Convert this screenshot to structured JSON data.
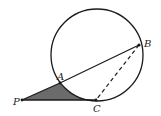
{
  "diagram": {
    "type": "geometry",
    "colors": {
      "stroke": "#1a1a1a",
      "shade": "#6b6b6b",
      "background": "#ffffff"
    },
    "circle": {
      "cx": 97,
      "cy": 55,
      "r": 46
    },
    "points": {
      "P": {
        "label": "P",
        "x": 22,
        "y": 100
      },
      "A": {
        "label": "A",
        "x": 60,
        "y": 83
      },
      "B": {
        "label": "B",
        "x": 139,
        "y": 45
      },
      "C": {
        "label": "C",
        "x": 96,
        "y": 100
      }
    },
    "segments": [
      {
        "from": "A",
        "to": "B",
        "style": "solid"
      },
      {
        "from": "P",
        "to": "A",
        "style": "solid"
      },
      {
        "from": "P",
        "to": "C",
        "style": "solid"
      },
      {
        "from": "B",
        "to": "C",
        "style": "dashed"
      }
    ],
    "shaded_region": "region bounded by PA, PC and arc AC",
    "labels": {
      "P": "P",
      "A": "A",
      "B": "B",
      "C": "C"
    }
  }
}
